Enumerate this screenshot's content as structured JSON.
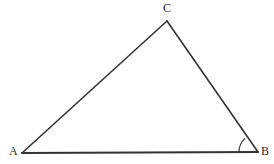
{
  "figure": {
    "kind": "geometry-diagram",
    "shape": "triangle",
    "canvas": {
      "width": 274,
      "height": 164
    },
    "background_color": "#ffffff",
    "stroke_color": "#333333",
    "stroke_width": 1.5,
    "baseline_stroke_width": 2
  },
  "vertices": [
    {
      "id": "A",
      "label": "A",
      "x": 22,
      "y": 153,
      "label_x": 9,
      "label_y": 145
    },
    {
      "id": "B",
      "label": "B",
      "x": 258,
      "y": 152,
      "label_x": 261,
      "label_y": 145
    },
    {
      "id": "C",
      "label": "C",
      "x": 167,
      "y": 21,
      "label_x": 163,
      "label_y": 2
    }
  ],
  "edges": [
    {
      "id": "AB",
      "from": "A",
      "to": "B",
      "name": "base-segment"
    },
    {
      "id": "AC",
      "from": "A",
      "to": "C",
      "name": "left-segment"
    },
    {
      "id": "CB",
      "from": "C",
      "to": "B",
      "name": "right-segment"
    }
  ],
  "angle_marks": [
    {
      "id": "angle-B",
      "at_vertex": "B",
      "radius": 19,
      "arc_path": "M 239 152 A 19 19 0 0 1 244.8 138.4",
      "stroke_color": "#333333",
      "stroke_width": 1.2
    }
  ],
  "paths": {
    "triangle_outline": "M 22 153 L 167 21 L 258 152 Z",
    "base_segment": "M 22 153 L 258 152",
    "left_segment": "M 22 153 L 167 21",
    "right_segment": "M 167 21 L 258 152"
  }
}
